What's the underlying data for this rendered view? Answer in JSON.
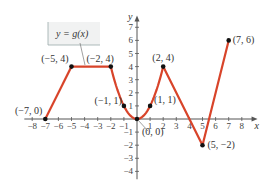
{
  "chart_data": {
    "type": "line",
    "title": "",
    "function_label": "y = g(x)",
    "xlabel": "x",
    "ylabel": "y",
    "xlim": [
      -8,
      8
    ],
    "ylim": [
      -4,
      7
    ],
    "grid": false,
    "x_ticks": [
      -8,
      -7,
      -6,
      -5,
      -4,
      -3,
      -2,
      -1,
      1,
      2,
      3,
      4,
      5,
      6,
      7,
      8
    ],
    "x_tick_labels": [
      "−8",
      "−7",
      "−6",
      "−5",
      "−4",
      "−3",
      "−2",
      "−1",
      "1",
      "2",
      "3",
      "4",
      "5",
      "6",
      "7",
      "8"
    ],
    "y_ticks": [
      -4,
      -3,
      -2,
      -1,
      1,
      2,
      3,
      4,
      5,
      6,
      7
    ],
    "y_tick_labels": [
      "−4",
      "−3",
      "−2",
      "−1",
      "1",
      "2",
      "3",
      "4",
      "5",
      "6",
      "7"
    ],
    "series": [
      {
        "name": "g(x)",
        "color": "#d8442a",
        "segments": [
          {
            "kind": "line",
            "points": [
              [
                -7,
                0
              ],
              [
                -5,
                4
              ]
            ]
          },
          {
            "kind": "line",
            "points": [
              [
                -5,
                4
              ],
              [
                -2,
                4
              ]
            ]
          },
          {
            "kind": "parabola",
            "equation": "y = x^2",
            "x_range": [
              -2,
              2
            ]
          },
          {
            "kind": "line",
            "points": [
              [
                2,
                4
              ],
              [
                5,
                -2
              ]
            ]
          },
          {
            "kind": "line",
            "points": [
              [
                5,
                -2
              ],
              [
                7,
                6
              ]
            ]
          }
        ]
      }
    ],
    "labeled_points": [
      {
        "x": -7,
        "y": 0,
        "label": "(−7, 0)"
      },
      {
        "x": -5,
        "y": 4,
        "label": "(−5, 4)"
      },
      {
        "x": -2,
        "y": 4,
        "label": "(−2, 4)"
      },
      {
        "x": -1,
        "y": 1,
        "label": "(−1, 1)"
      },
      {
        "x": 0,
        "y": 0,
        "label": "(0, 0)"
      },
      {
        "x": 1,
        "y": 1,
        "label": "(1, 1)"
      },
      {
        "x": 2,
        "y": 4,
        "label": "(2, 4)"
      },
      {
        "x": 5,
        "y": -2,
        "label": "(5, −2)"
      },
      {
        "x": 7,
        "y": 6,
        "label": "(7, 6)"
      }
    ]
  },
  "colors": {
    "curve": "#d8442a",
    "axis": "#555555",
    "point": "#111111",
    "label_box_bg": "#f1f2f2"
  }
}
